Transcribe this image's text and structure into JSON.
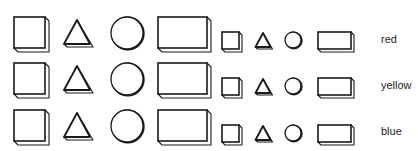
{
  "shapes": [
    "square",
    "triangle",
    "circle",
    "rectangle"
  ],
  "sizes": [
    "large",
    "small"
  ],
  "rows": [
    {
      "color": "red"
    },
    {
      "color": "yellow"
    },
    {
      "color": "blue"
    }
  ],
  "style": {
    "stroke": "#1a1a1a",
    "fill": "#ffffff"
  }
}
